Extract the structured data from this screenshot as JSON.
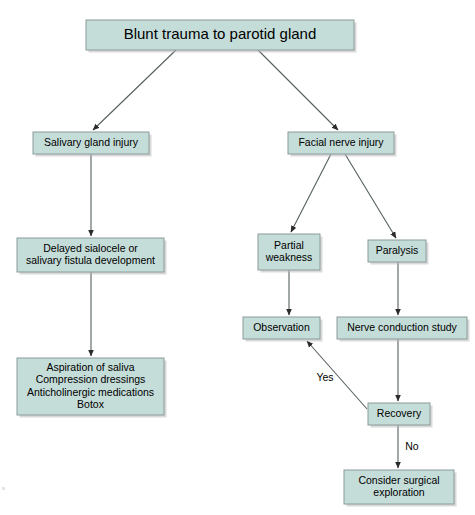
{
  "diagram": {
    "type": "flowchart",
    "title": "Blunt trauma to parotid gland",
    "orientation": "top-down",
    "palette": {
      "node_fill": "#c5ddd9",
      "node_border": "#8a9a99",
      "edge_color": "#555f5f",
      "text_color": "#000000",
      "background": "#ffffff"
    },
    "nodes": [
      {
        "id": "root",
        "label": "Blunt trauma to parotid gland",
        "lines": [
          "Blunt trauma to parotid gland"
        ],
        "x": 86,
        "y": 20,
        "w": 268,
        "h": 30,
        "text_size": "title"
      },
      {
        "id": "salivary-gland-injury",
        "label": "Salivary gland injury",
        "lines": [
          "Salivary gland injury"
        ],
        "x": 33,
        "y": 132,
        "w": 116,
        "h": 22,
        "text_size": "body"
      },
      {
        "id": "facial-nerve-injury",
        "label": "Facial nerve injury",
        "lines": [
          "Facial nerve injury"
        ],
        "x": 288,
        "y": 132,
        "w": 106,
        "h": 22,
        "text_size": "body"
      },
      {
        "id": "delayed-sialocele",
        "label": "Delayed sialocele or salivary fistula development",
        "lines": [
          "Delayed sialocele or",
          "salivary fistula development"
        ],
        "x": 17,
        "y": 238,
        "w": 147,
        "h": 34,
        "text_size": "body"
      },
      {
        "id": "partial-weakness",
        "label": "Partial weakness",
        "lines": [
          "Partial",
          "weakness"
        ],
        "x": 258,
        "y": 234,
        "w": 62,
        "h": 36,
        "text_size": "body"
      },
      {
        "id": "paralysis",
        "label": "Paralysis",
        "lines": [
          "Paralysis"
        ],
        "x": 368,
        "y": 240,
        "w": 58,
        "h": 22,
        "text_size": "body"
      },
      {
        "id": "observation",
        "label": "Observation",
        "lines": [
          "Observation"
        ],
        "x": 243,
        "y": 317,
        "w": 77,
        "h": 22,
        "text_size": "body"
      },
      {
        "id": "nerve-conduction-study",
        "label": "Nerve conduction study",
        "lines": [
          "Nerve conduction study"
        ],
        "x": 337,
        "y": 317,
        "w": 130,
        "h": 22,
        "text_size": "body"
      },
      {
        "id": "aspiration-treatments",
        "label": "Aspiration of saliva; Compression dressings; Anticholinergic medications; Botox",
        "lines": [
          "Aspiration of saliva",
          "Compression dressings",
          "Anticholinergic medications",
          "Botox"
        ],
        "x": 17,
        "y": 358,
        "w": 147,
        "h": 57,
        "text_size": "body"
      },
      {
        "id": "recovery",
        "label": "Recovery",
        "lines": [
          "Recovery"
        ],
        "x": 368,
        "y": 403,
        "w": 62,
        "h": 22,
        "text_size": "body"
      },
      {
        "id": "consider-surgical-exploration",
        "label": "Consider surgical exploration",
        "lines": [
          "Consider surgical",
          "exploration"
        ],
        "x": 344,
        "y": 470,
        "w": 110,
        "h": 34,
        "text_size": "body"
      }
    ],
    "edges": [
      {
        "id": "root-to-salivary",
        "from": "root",
        "to": "salivary-gland-injury",
        "label": "",
        "x1": 176,
        "y1": 50,
        "x2": 93,
        "y2": 130
      },
      {
        "id": "root-to-facial",
        "from": "root",
        "to": "facial-nerve-injury",
        "label": "",
        "x1": 258,
        "y1": 50,
        "x2": 338,
        "y2": 130
      },
      {
        "id": "salivary-to-sialocele",
        "from": "salivary-gland-injury",
        "to": "delayed-sialocele",
        "label": "",
        "x1": 91,
        "y1": 154,
        "x2": 91,
        "y2": 236
      },
      {
        "id": "sialocele-to-aspiration",
        "from": "delayed-sialocele",
        "to": "aspiration-treatments",
        "label": "",
        "x1": 91,
        "y1": 272,
        "x2": 91,
        "y2": 356
      },
      {
        "id": "facial-to-partial",
        "from": "facial-nerve-injury",
        "to": "partial-weakness",
        "label": "",
        "x1": 331,
        "y1": 154,
        "x2": 291,
        "y2": 232
      },
      {
        "id": "facial-to-paralysis",
        "from": "facial-nerve-injury",
        "to": "paralysis",
        "label": "",
        "x1": 345,
        "y1": 154,
        "x2": 396,
        "y2": 238
      },
      {
        "id": "partial-to-observation",
        "from": "partial-weakness",
        "to": "observation",
        "label": "",
        "x1": 289,
        "y1": 270,
        "x2": 289,
        "y2": 315
      },
      {
        "id": "paralysis-to-ncs",
        "from": "paralysis",
        "to": "nerve-conduction-study",
        "label": "",
        "x1": 398,
        "y1": 262,
        "x2": 398,
        "y2": 315
      },
      {
        "id": "ncs-to-recovery",
        "from": "nerve-conduction-study",
        "to": "recovery",
        "label": "",
        "x1": 398,
        "y1": 339,
        "x2": 398,
        "y2": 401
      },
      {
        "id": "recovery-to-observation-yes",
        "from": "recovery",
        "to": "observation",
        "label": "Yes",
        "x1": 367,
        "y1": 409,
        "x2": 307,
        "y2": 341,
        "label_x": 325,
        "label_y": 378
      },
      {
        "id": "recovery-to-surgical-no",
        "from": "recovery",
        "to": "consider-surgical-exploration",
        "label": "No",
        "x1": 398,
        "y1": 425,
        "x2": 398,
        "y2": 468,
        "label_x": 412,
        "label_y": 447
      }
    ]
  }
}
